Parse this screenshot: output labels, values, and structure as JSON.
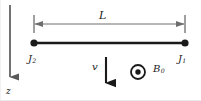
{
  "figure": {
    "width": 201,
    "height": 101,
    "background_color": "#ffffff",
    "line_color": "#1a1a1a",
    "dimension_line_color": "#6e6e6e",
    "axis_color": "#5a5a5a"
  },
  "labels": {
    "length": "L",
    "left_terminal": "J",
    "left_terminal_sub": "2",
    "right_terminal": "J",
    "right_terminal_sub": "1",
    "velocity": "v",
    "field": "B",
    "field_sub": "0",
    "axis": "z"
  },
  "elements": {
    "rod": {
      "name": "conducting-rod",
      "x1": 33,
      "y1": 43,
      "x2": 184,
      "y2": 43,
      "endpoint_radius": 3.4
    },
    "dimension": {
      "name": "length-dimension",
      "x1": 33,
      "x2": 184,
      "y": 24,
      "tick_top": 15,
      "tick_bottom": 33
    },
    "velocity_arrow": {
      "name": "velocity-arrow",
      "x": 105,
      "y1": 57,
      "y2": 92,
      "direction": "down"
    },
    "field_symbol": {
      "name": "field-out-of-page",
      "cx": 137,
      "cy": 72,
      "outer_radius": 7,
      "inner_radius": 2.6
    },
    "z_axis": {
      "name": "z-axis",
      "x": 9,
      "y1": 5,
      "y2": 84,
      "direction": "down"
    }
  }
}
